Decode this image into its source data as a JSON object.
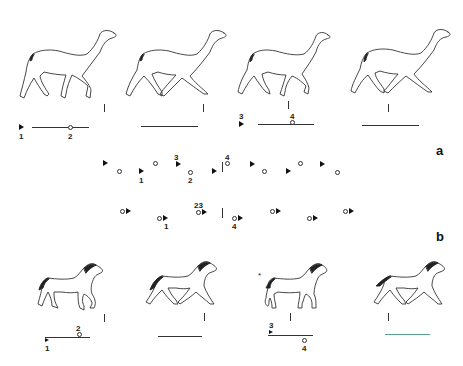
{
  "figure": {
    "panels": [
      {
        "label": "a",
        "subject": "camel",
        "description": "pace/walk footfall sequence"
      },
      {
        "label": "b",
        "subject": "horse",
        "description": "trot footfall sequence"
      }
    ],
    "camel_row": {
      "frames": [
        {
          "index": 1,
          "markers": [
            {
              "symbol": "filled-triangle",
              "label": "1"
            },
            {
              "symbol": "open-circle",
              "label": "2"
            }
          ]
        },
        {
          "index": 2,
          "markers": []
        },
        {
          "index": 3,
          "markers": [
            {
              "symbol": "filled-triangle",
              "label": "3"
            },
            {
              "symbol": "open-circle",
              "label": "4"
            }
          ]
        },
        {
          "index": 4,
          "markers": []
        }
      ]
    },
    "sequence_a": {
      "labels": [
        "3",
        "4",
        "1",
        "2"
      ],
      "legend": "a"
    },
    "sequence_b": {
      "labels": [
        "2",
        "3",
        "1",
        "4"
      ],
      "combined_label": "23",
      "legend": "b"
    },
    "horse_row": {
      "frames": [
        {
          "index": 1,
          "markers": [
            {
              "symbol": "filled-triangle",
              "label": "1"
            },
            {
              "symbol": "open-circle",
              "label": "2"
            }
          ]
        },
        {
          "index": 2,
          "markers": []
        },
        {
          "index": 3,
          "markers": [
            {
              "symbol": "filled-triangle",
              "label": "3"
            },
            {
              "symbol": "open-circle",
              "label": "4"
            }
          ],
          "asterisk": "*"
        },
        {
          "index": 4,
          "markers": []
        }
      ]
    },
    "text": {
      "a": "a",
      "b": "b",
      "n1": "1",
      "n2": "2",
      "n3": "3",
      "n4": "4",
      "n23": "23",
      "star": "*"
    }
  }
}
